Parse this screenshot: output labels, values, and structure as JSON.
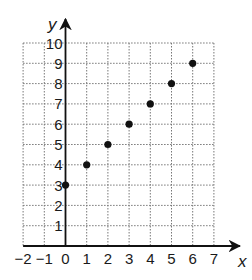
{
  "chart_data": {
    "type": "scatter",
    "title": "",
    "xlabel": "x",
    "ylabel": "y",
    "xlim": [
      -2,
      7
    ],
    "ylim": [
      0,
      10
    ],
    "grid": true,
    "grid_style": "dotted",
    "x_ticks": [
      "-2",
      "-1",
      "0",
      "1",
      "2",
      "3",
      "4",
      "5",
      "6",
      "7"
    ],
    "y_ticks": [
      "1",
      "2",
      "3",
      "4",
      "5",
      "6",
      "7",
      "8",
      "9",
      "10"
    ],
    "series": [
      {
        "name": "points",
        "x": [
          0,
          1,
          2,
          3,
          4,
          5,
          6
        ],
        "y": [
          3,
          4,
          5,
          6,
          7,
          8,
          9
        ]
      }
    ],
    "legend": null,
    "colors": {
      "point": "#111111",
      "axis": "#111111",
      "grid": "#777777"
    }
  }
}
